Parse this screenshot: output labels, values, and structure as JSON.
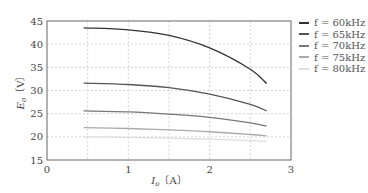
{
  "chart_data": {
    "type": "line",
    "title": "",
    "xlabel": "I_o [A]",
    "ylabel": "E_o [V]",
    "xlim": [
      0,
      3
    ],
    "ylim": [
      15,
      45
    ],
    "xticks": [
      0,
      1,
      2,
      3
    ],
    "yticks": [
      15,
      20,
      25,
      30,
      35,
      40,
      45
    ],
    "grid": true,
    "legend_position": "right-outside",
    "x": [
      0.45,
      1.0,
      1.5,
      2.0,
      2.5,
      2.7
    ],
    "series": [
      {
        "name": "f = 60kHz",
        "color": "#333333",
        "values": [
          43.5,
          43.1,
          41.9,
          39.2,
          34.6,
          31.5
        ]
      },
      {
        "name": "f = 65kHz",
        "color": "#555555",
        "values": [
          31.6,
          31.3,
          30.6,
          29.2,
          27.0,
          25.6
        ]
      },
      {
        "name": "f = 70kHz",
        "color": "#777777",
        "values": [
          25.6,
          25.4,
          24.9,
          24.2,
          23.0,
          22.3
        ]
      },
      {
        "name": "f = 75kHz",
        "color": "#aaaaaa",
        "values": [
          22.0,
          21.8,
          21.5,
          21.1,
          20.5,
          20.2
        ]
      },
      {
        "name": "f = 80kHz",
        "color": "#dddddd",
        "values": [
          20.0,
          19.9,
          19.7,
          19.5,
          19.2,
          19.0
        ]
      }
    ]
  },
  "axes": {
    "xlabel_text": "I",
    "xlabel_sub": "o",
    "xlabel_unit": "〔A〕",
    "ylabel_text": "E",
    "ylabel_sub": "o",
    "ylabel_unit": "〔V〕"
  },
  "legend": [
    {
      "label": "f = 60kHz",
      "color": "#333333"
    },
    {
      "label": "f = 65kHz",
      "color": "#555555"
    },
    {
      "label": "f = 70kHz",
      "color": "#777777"
    },
    {
      "label": "f = 75kHz",
      "color": "#aaaaaa"
    },
    {
      "label": "f = 80kHz",
      "color": "#dddddd"
    }
  ]
}
